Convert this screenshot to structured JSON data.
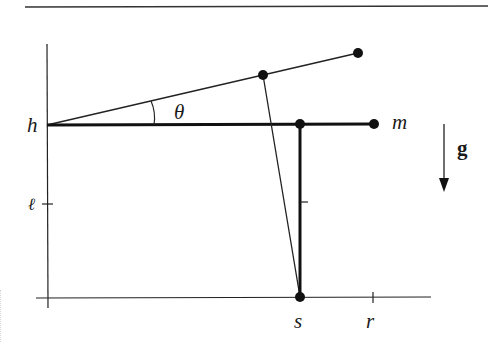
{
  "diagram": {
    "title": "",
    "colors": {
      "ink": "#1a1a1a",
      "background": "#ffffff"
    },
    "labels": {
      "h": "h",
      "theta": "θ",
      "m": "m",
      "g": "g",
      "ell": "ℓ",
      "s": "s",
      "r": "r"
    },
    "elements": {
      "top_rule": "horizontal rule",
      "vertical_axis": "vertical axis",
      "horizontal_axis": "horizontal axis",
      "arm_horizontal": "thick horizontal arm from h to mass m",
      "arm_tilted": "thin arm tilted by angle theta",
      "post_vertical": "thick vertical post at s",
      "link": "thin link from tilted arm to base at s",
      "gravity_arrow": "downward arrow labeled g"
    }
  }
}
